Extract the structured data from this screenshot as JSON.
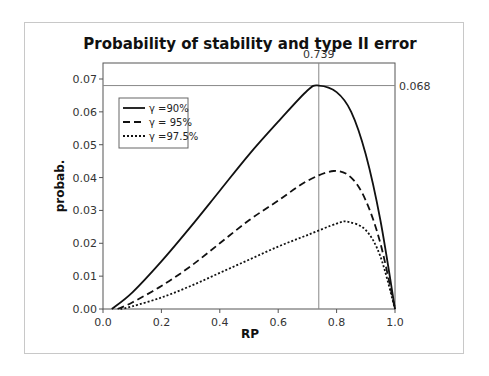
{
  "chart_data": {
    "type": "line",
    "title": "Probability of stability and type II error",
    "xlabel": "RP",
    "ylabel": "probab.",
    "xlim": [
      0.0,
      1.0
    ],
    "ylim": [
      0.0,
      0.072
    ],
    "xticks": [
      "0.0",
      "0.2",
      "0.4",
      "0.6",
      "0.8",
      "1.0"
    ],
    "yticks": [
      "0.00",
      "0.01",
      "0.02",
      "0.03",
      "0.04",
      "0.05",
      "0.06",
      "0.07"
    ],
    "grid": false,
    "legend_position": "upper-left",
    "reference_lines": {
      "vertical": {
        "x": 0.739,
        "label": "0.739"
      },
      "horizontal": {
        "y": 0.068,
        "label": "0.068"
      }
    },
    "series": [
      {
        "name": "γ =90%",
        "style": "solid",
        "x": [
          0.03,
          0.1,
          0.2,
          0.3,
          0.4,
          0.5,
          0.6,
          0.7,
          0.739,
          0.8,
          0.85,
          0.9,
          0.95,
          1.0
        ],
        "y": [
          0.0,
          0.005,
          0.0145,
          0.025,
          0.036,
          0.047,
          0.057,
          0.0665,
          0.068,
          0.066,
          0.06,
          0.047,
          0.027,
          0.0
        ]
      },
      {
        "name": "γ = 95%",
        "style": "dashed",
        "x": [
          0.05,
          0.1,
          0.2,
          0.3,
          0.4,
          0.5,
          0.6,
          0.7,
          0.79,
          0.85,
          0.9,
          0.95,
          1.0
        ],
        "y": [
          0.0,
          0.002,
          0.007,
          0.013,
          0.02,
          0.027,
          0.033,
          0.039,
          0.042,
          0.04,
          0.033,
          0.02,
          0.0
        ]
      },
      {
        "name": "γ =97.5%",
        "style": "dotted",
        "x": [
          0.06,
          0.1,
          0.2,
          0.3,
          0.4,
          0.5,
          0.6,
          0.7,
          0.8,
          0.84,
          0.9,
          0.95,
          1.0
        ],
        "y": [
          0.0,
          0.0008,
          0.0035,
          0.007,
          0.011,
          0.015,
          0.019,
          0.0225,
          0.026,
          0.0265,
          0.024,
          0.016,
          0.0
        ]
      }
    ]
  }
}
